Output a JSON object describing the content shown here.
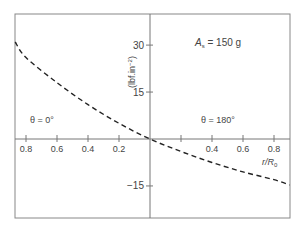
{
  "chart_data": {
    "type": "line",
    "title": "",
    "annotation": "A_s = 150 g",
    "annotation_parts": {
      "symbol": "A",
      "subscript": "s",
      "rest": " = 150 g"
    },
    "xlabel": "r/R₀",
    "xlabel_parts": {
      "main": "r/R",
      "subscript": "0"
    },
    "ylabel": "(lbf.in⁻²)",
    "ylabel_parts": {
      "main": "(lbf.in",
      "superscript": "−2",
      "close": ")"
    },
    "region_labels": [
      {
        "text": "θ = 0°",
        "side": "left"
      },
      {
        "text": "θ = 180°",
        "side": "right"
      }
    ],
    "x_axis": {
      "description": "Signed position: negative side = θ=0° (labels show |r/R₀|), positive side = θ=180°",
      "range": [
        -0.87,
        0.9
      ],
      "ticks": [
        -0.8,
        -0.6,
        -0.4,
        -0.2,
        0.2,
        0.4,
        0.6,
        0.8
      ],
      "tick_labels": [
        "0.8",
        "0.6",
        "0.4",
        "0.2",
        "",
        "0.4",
        "0.6",
        "0.8"
      ]
    },
    "y_axis": {
      "range": [
        -25,
        40
      ],
      "ticks": [
        30,
        15,
        -15
      ],
      "tick_labels": [
        "30",
        "15",
        "−15"
      ]
    },
    "grid": false,
    "legend": null,
    "series": [
      {
        "name": "A_s = 150 g",
        "style": "dashed",
        "x": [
          -0.87,
          -0.8,
          -0.6,
          -0.4,
          -0.2,
          0.0,
          0.2,
          0.4,
          0.6,
          0.8,
          0.9
        ],
        "values": [
          31,
          26,
          18,
          11,
          5,
          0,
          -4,
          -7.5,
          -10.5,
          -13,
          -14.7
        ]
      }
    ]
  },
  "colors": {
    "axis": "#777777",
    "frame": "#888888",
    "curve": "#222222",
    "text": "#444444"
  }
}
